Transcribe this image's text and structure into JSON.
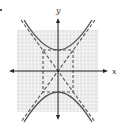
{
  "figure": {
    "type": "hyperbola-graph",
    "equation_form": "y^2/a^2 - x^2/b^2 = 1",
    "orientation": "vertical",
    "a": 6,
    "b": 4,
    "center": [
      0,
      0
    ],
    "grid_range": {
      "x": [
        -11,
        11
      ],
      "y": [
        -11,
        11
      ]
    },
    "elements": [
      "grid",
      "axes",
      "hyperbola-branches",
      "asymptotes-dashed",
      "central-rectangle-dashed"
    ]
  },
  "axes": {
    "x_label": "x",
    "y_label": "y"
  },
  "colors": {
    "grid_fill": "#e6e6e6",
    "grid_line": "#ffffff",
    "axis": "#222222",
    "curve": "#555555",
    "dashed": "#555555"
  }
}
